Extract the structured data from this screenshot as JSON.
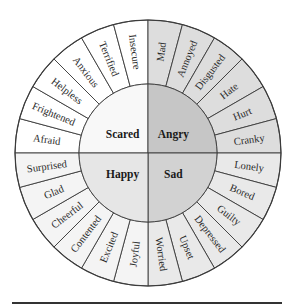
{
  "wheel": {
    "center": [
      148,
      153
    ],
    "outer_radius": 133,
    "inner_radius": 69,
    "quadrants": [
      {
        "name": "Scared",
        "position": "top-left",
        "core_color": "#f8f8f8",
        "ring_color": "#ffffff",
        "emotions": [
          "Afraid",
          "Frightened",
          "Helpless",
          "Anxious",
          "Terrified",
          "Insecure"
        ]
      },
      {
        "name": "Angry",
        "position": "top-right",
        "core_color": "#c6c6c6",
        "ring_color": "#dddddd",
        "emotions": [
          "Mad",
          "Annoyed",
          "Disgusted",
          "Hate",
          "Hurt",
          "Cranky"
        ]
      },
      {
        "name": "Sad",
        "position": "bottom-right",
        "core_color": "#d2d2d2",
        "ring_color": "#e9e9e9",
        "emotions": [
          "Lonely",
          "Bored",
          "Guilty",
          "Depressed",
          "Upset",
          "Worried"
        ]
      },
      {
        "name": "Happy",
        "position": "bottom-left",
        "core_color": "#e6e6e6",
        "ring_color": "#f4f4f4",
        "emotions": [
          "Joyful",
          "Excited",
          "Contented",
          "Cheerful",
          "Glad",
          "Surprised"
        ]
      }
    ]
  },
  "colors": {
    "stroke": "#3a3a3a",
    "text": "#2a2a2a"
  }
}
